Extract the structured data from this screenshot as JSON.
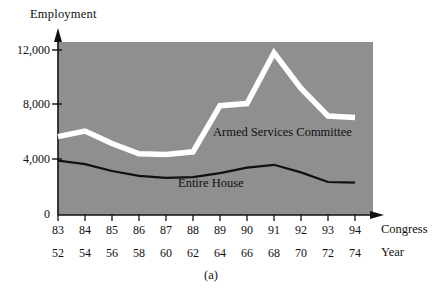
{
  "figure": {
    "caption": "(a)",
    "y_axis_title": "Employment",
    "x_axis_title_primary": "Congress",
    "x_axis_title_secondary": "Year",
    "plot_background_color": "#8f8f8f",
    "series_label_armed": "Armed Services Committee",
    "series_label_house": "Entire House"
  },
  "chart_data": {
    "type": "line",
    "title": "",
    "subtitle": "",
    "xlabel": "Congress",
    "xlabel_secondary": "Year",
    "ylabel": "Employment",
    "ylim": [
      0,
      13500
    ],
    "xlim_categories": [
      "83",
      "84",
      "85",
      "86",
      "87",
      "88",
      "89",
      "90",
      "91",
      "92",
      "93",
      "94"
    ],
    "grid": false,
    "legend": "inline-annotations",
    "y_ticks": [
      0,
      4000,
      8000,
      12000
    ],
    "y_tick_labels": [
      "0",
      "4,000",
      "8,000",
      "12,000"
    ],
    "x_ticks_congress": [
      "83",
      "84",
      "85",
      "86",
      "87",
      "88",
      "89",
      "90",
      "91",
      "92",
      "93",
      "94"
    ],
    "x_ticks_year": [
      "52",
      "54",
      "56",
      "58",
      "60",
      "62",
      "64",
      "66",
      "68",
      "70",
      "72",
      "74"
    ],
    "categories": [
      "83",
      "84",
      "85",
      "86",
      "87",
      "88",
      "89",
      "90",
      "91",
      "92",
      "93",
      "94"
    ],
    "series": [
      {
        "name": "Armed Services Committee",
        "color": "#ffffff",
        "values": [
          5700,
          6100,
          5200,
          4450,
          4400,
          4600,
          7950,
          8100,
          11800,
          9200,
          7200,
          7100
        ]
      },
      {
        "name": "Entire House",
        "color": "#111111",
        "values": [
          3950,
          3700,
          3200,
          2850,
          2700,
          2750,
          3050,
          3450,
          3650,
          3100,
          2400,
          2350
        ]
      }
    ],
    "annotations": [
      {
        "text": "Armed Services Committee",
        "x": "89",
        "y": 6900
      },
      {
        "text": "Entire House",
        "x": "87",
        "y": 3000
      },
      {
        "text": "(a)",
        "position": "below-axis-center"
      }
    ]
  }
}
